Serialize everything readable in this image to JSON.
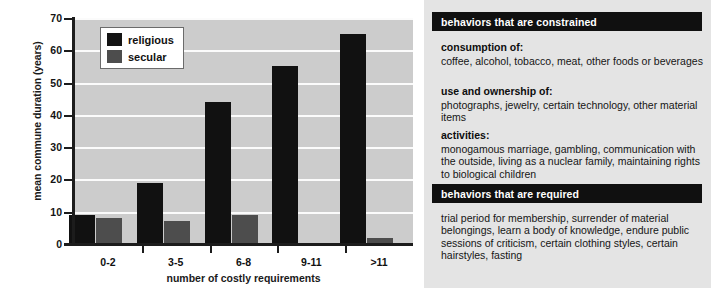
{
  "chart_data": {
    "type": "bar",
    "title": "",
    "xlabel": "number of costly requirements",
    "ylabel": "mean commune duration (years)",
    "categories": [
      "0-2",
      "3-5",
      "6-8",
      "9-11",
      ">11"
    ],
    "series": [
      {
        "name": "religious",
        "color": "#111111",
        "values": [
          9,
          19,
          44,
          55,
          65
        ]
      },
      {
        "name": "secular",
        "color": "#4d4d4d",
        "values": [
          8,
          7,
          9,
          0,
          2
        ]
      }
    ],
    "ylim": [
      0,
      70
    ],
    "yticks": [
      0,
      10,
      20,
      30,
      40,
      50,
      60,
      70
    ],
    "ytick_labels": [
      "0",
      "10",
      "20",
      "30",
      "40",
      "50",
      "60",
      "70"
    ],
    "grid": "horizontal-white",
    "legend_position": "top-left",
    "plot_background": "#cccccc"
  },
  "legend": {
    "entries": [
      {
        "label": "religious",
        "swatch": "#141414"
      },
      {
        "label": "secular",
        "swatch": "#4d4d4d"
      }
    ]
  },
  "info_panel": {
    "background": "#e4e4e4",
    "sections": [
      {
        "header": "behaviors that are constrained",
        "blocks": [
          {
            "title": "consumption of:",
            "body": "coffee, alcohol, tobacco, meat, other foods or beverages"
          },
          {
            "title": "use and ownership of:",
            "body": "photographs, jewelry, certain technology, other material items"
          },
          {
            "title": "activities:",
            "body": "monogamous marriage, gambling, communication with the outside, living as a nuclear family, maintaining rights to biological children"
          }
        ]
      },
      {
        "header": "behaviors that are required",
        "blocks": [
          {
            "title": "",
            "body": "trial period for membership, surrender of material belongings, learn a body of knowledge, endure public sessions of criticism, certain clothing styles, certain hairstyles, fasting"
          }
        ]
      }
    ]
  }
}
